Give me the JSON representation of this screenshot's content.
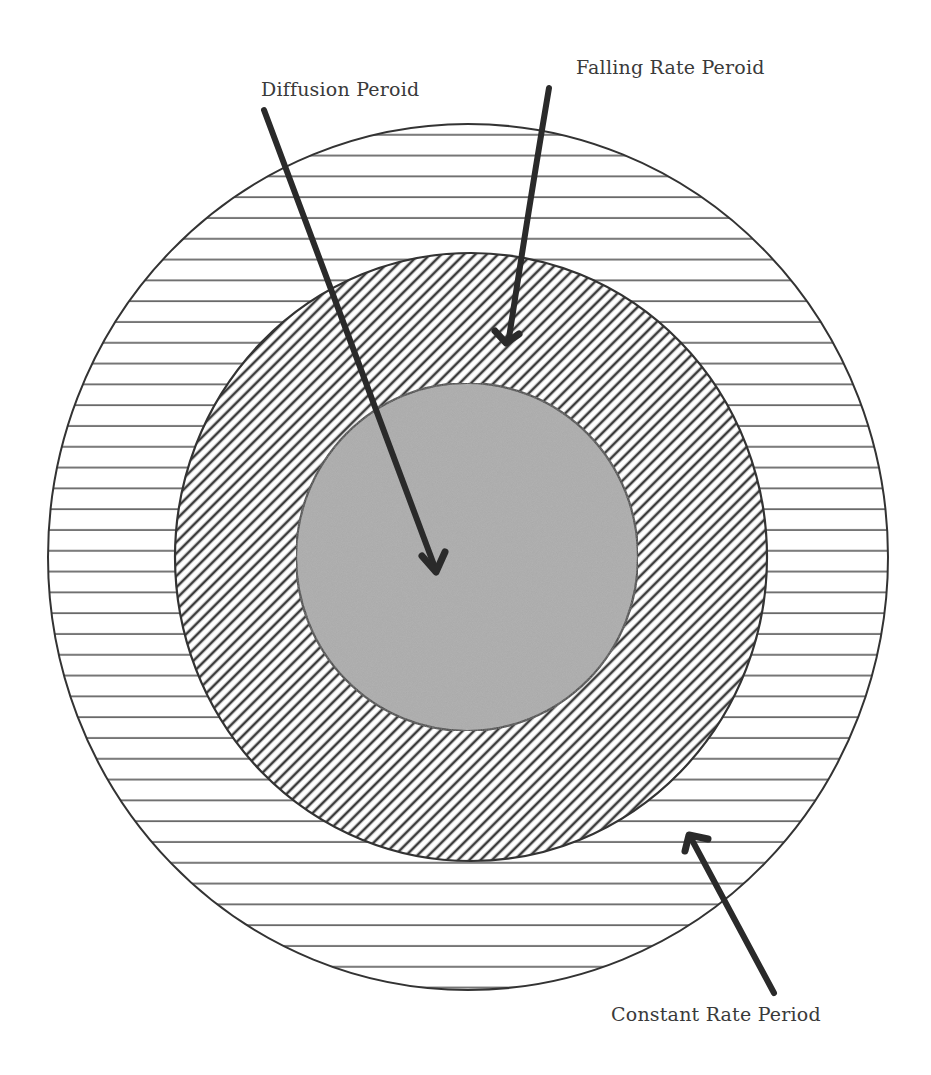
{
  "diagram": {
    "type": "concentric-zones",
    "labels": {
      "diffusion": "Diffusion Peroid",
      "falling": "Falling Rate Peroid",
      "constant": "Constant Rate Period"
    },
    "zones": [
      {
        "name": "Constant Rate Period",
        "pattern": "horizontal-lines",
        "cx": 468,
        "cy": 557,
        "rx": 420,
        "ry": 433
      },
      {
        "name": "Falling Rate Period",
        "pattern": "diagonal-hatch",
        "cx": 471,
        "cy": 557,
        "rx": 296,
        "ry": 304
      },
      {
        "name": "Diffusion Period",
        "pattern": "solid-gray",
        "cx": 467,
        "cy": 557,
        "rx": 171,
        "ry": 174
      }
    ],
    "colors": {
      "stroke": "#333333",
      "hatch": "#3c3c3c",
      "inner_fill": "#a9a9a9",
      "arrow": "#2a2a2a",
      "text": "#3a3a3a"
    }
  }
}
